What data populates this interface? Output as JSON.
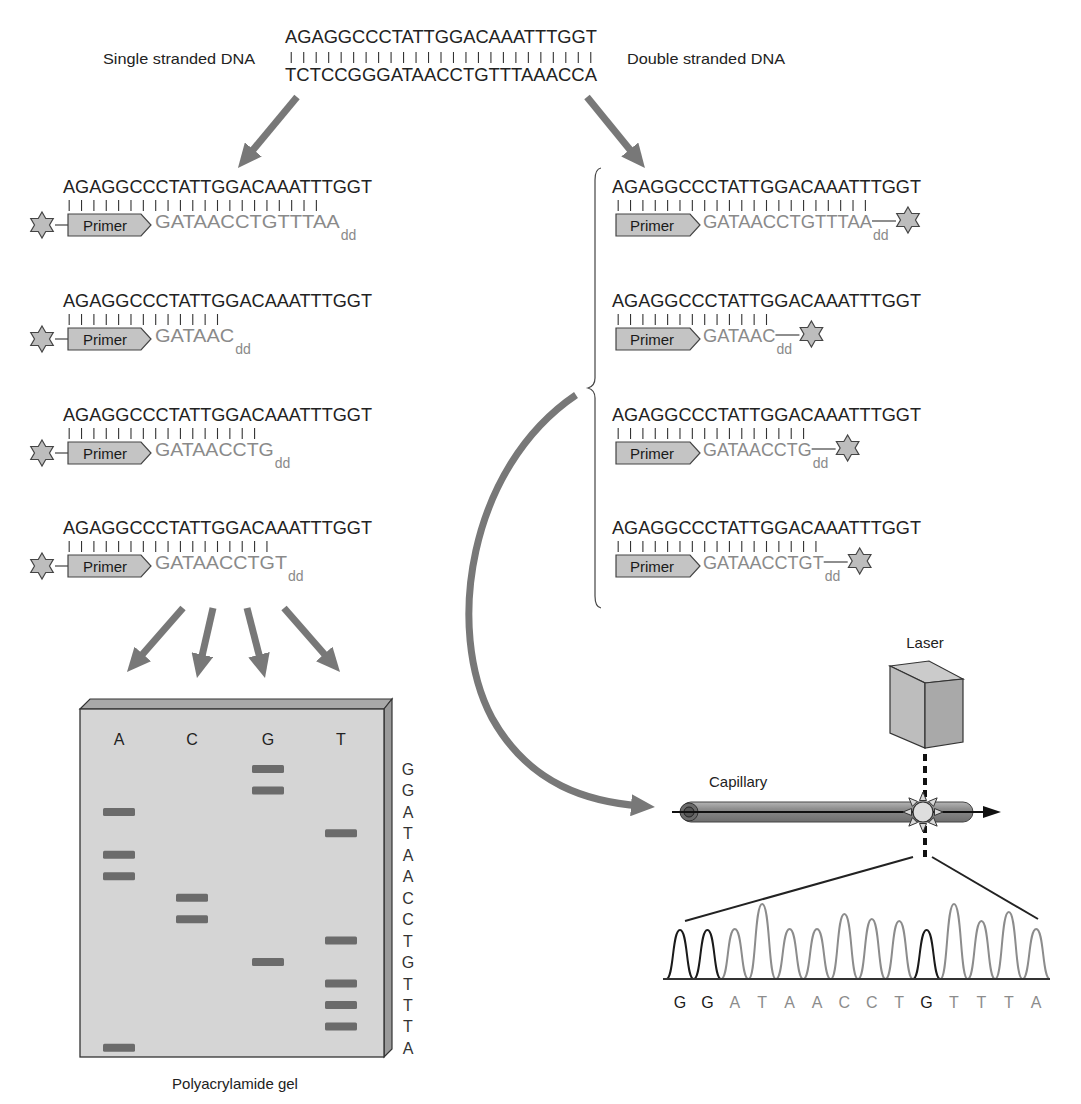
{
  "labels": {
    "single_stranded": "Single stranded DNA",
    "double_stranded": "Double stranded DNA",
    "gel_caption": "Polyacrylamide gel",
    "capillary": "Capillary",
    "laser": "Laser"
  },
  "template_duplex": {
    "top_strand": "AGAGGCCCTATTGGACAAATTTGGT",
    "bottom_strand": "TCTCCGGGATAACCTGTTTAAACCA",
    "paired_count": 25
  },
  "single_stranded_panel": {
    "rows": [
      {
        "template": "AGAGGCCCTATTGGACAAATTTGGT",
        "primer_label": "Primer",
        "extension": "GATAACCTGTTTAA",
        "terminator": "dd",
        "paired_count": 21
      },
      {
        "template": "AGAGGCCCTATTGGACAAATTTGGT",
        "primer_label": "Primer",
        "extension": "GATAAC",
        "terminator": "dd",
        "paired_count": 13
      },
      {
        "template": "AGAGGCCCTATTGGACAAATTTGGT",
        "primer_label": "Primer",
        "extension": "GATAACCTG",
        "terminator": "dd",
        "paired_count": 16
      },
      {
        "template": "AGAGGCCCTATTGGACAAATTTGGT",
        "primer_label": "Primer",
        "extension": "GATAACCTGT",
        "terminator": "dd",
        "paired_count": 17
      }
    ]
  },
  "double_stranded_panel": {
    "rows": [
      {
        "template": "AGAGGCCCTATTGGACAAATTTGGT",
        "primer_label": "Primer",
        "extension": "GATAACCTGTTTAA",
        "terminator": "dd",
        "paired_count": 21
      },
      {
        "template": "AGAGGCCCTATTGGACAAATTTGGT",
        "primer_label": "Primer",
        "extension": "GATAAC",
        "terminator": "dd",
        "paired_count": 13
      },
      {
        "template": "AGAGGCCCTATTGGACAAATTTGGT",
        "primer_label": "Primer",
        "extension": "GATAACCTG",
        "terminator": "dd",
        "paired_count": 16
      },
      {
        "template": "AGAGGCCCTATTGGACAAATTTGGT",
        "primer_label": "Primer",
        "extension": "GATAACCTGT",
        "terminator": "dd",
        "paired_count": 17
      }
    ]
  },
  "gel": {
    "lanes": [
      "A",
      "C",
      "G",
      "T"
    ],
    "read_sequence": [
      "G",
      "G",
      "A",
      "T",
      "A",
      "A",
      "C",
      "C",
      "T",
      "G",
      "T",
      "T",
      "T",
      "A"
    ]
  },
  "chromatogram": {
    "bases": [
      "G",
      "G",
      "A",
      "T",
      "A",
      "A",
      "C",
      "C",
      "T",
      "G",
      "T",
      "T",
      "T",
      "A"
    ],
    "peak_heights": [
      49,
      49,
      50,
      75,
      50,
      50,
      65,
      60,
      58,
      49,
      75,
      58,
      67,
      50
    ]
  },
  "colors": {
    "arrow": "#787878",
    "gel_face": "#d5d5d5",
    "gel_band": "#6b6b6b",
    "trace_G": "#1a1a1a",
    "trace_other": "#8c8c8c",
    "extension_text": "#8a8a8a"
  }
}
